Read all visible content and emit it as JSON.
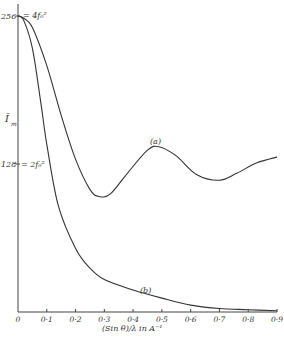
{
  "chart_data": {
    "type": "line",
    "title": "",
    "xlabel": "(Sin θ)/λ in A⁻¹",
    "ylabel": "Ī_m",
    "xlim": [
      0,
      0.9
    ],
    "ylim": [
      0,
      256
    ],
    "x_ticks": [
      "0",
      "0·1",
      "0·2",
      "0·3",
      "0·4",
      "0·5",
      "0·6",
      "0·7",
      "0·8",
      "0·9"
    ],
    "y_ticks": [
      {
        "value": 256,
        "label": "256",
        "annotation": "= 4f₀²"
      },
      {
        "value": 128,
        "label": "128",
        "annotation": "= 2f₀²"
      }
    ],
    "grid": false,
    "series": [
      {
        "name": "(a)",
        "x": [
          0,
          0.02,
          0.05,
          0.1,
          0.15,
          0.2,
          0.25,
          0.28,
          0.32,
          0.38,
          0.45,
          0.49,
          0.55,
          0.62,
          0.7,
          0.76,
          0.83,
          0.9
        ],
        "y": [
          256,
          254,
          246,
          213,
          170,
          132,
          106,
          100,
          102,
          120,
          140,
          143,
          135,
          119,
          114,
          120,
          129,
          134
        ]
      },
      {
        "name": "(b)",
        "x": [
          0,
          0.02,
          0.05,
          0.08,
          0.1,
          0.14,
          0.2,
          0.25,
          0.3,
          0.4,
          0.5,
          0.6,
          0.7,
          0.8,
          0.9
        ],
        "y": [
          256,
          252,
          228,
          180,
          145,
          92,
          55,
          38,
          28,
          19,
          12,
          6,
          3,
          2,
          1
        ]
      }
    ]
  },
  "labels": {
    "y_top": "256",
    "y_top_eq": "= 4f₀²",
    "y_mid": "128",
    "y_mid_eq": "= 2f₀²",
    "y_axis": "Ī",
    "y_axis_sub": "m",
    "curve_a": "(a)",
    "curve_b": "(b)",
    "x_axis": "(Sin θ)/λ in A⁻¹"
  }
}
